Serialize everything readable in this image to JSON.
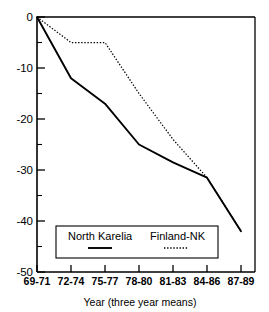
{
  "chart_data": {
    "type": "line",
    "title": "",
    "subtitle": "",
    "xlabel": "Year (three year means)",
    "ylabel": "",
    "categories": [
      "69-71",
      "72-74",
      "75-77",
      "78-80",
      "81-83",
      "84-86",
      "87-89"
    ],
    "series": [
      {
        "name": "North Karelia",
        "style": "solid",
        "color": "#000000",
        "values": [
          0,
          -12,
          -17,
          -25,
          -28.5,
          -31.5,
          -42
        ]
      },
      {
        "name": "Finland-NK",
        "style": "dotted",
        "color": "#000000",
        "values": [
          0,
          -5,
          -5,
          -15,
          -24,
          -31.5,
          -42
        ]
      }
    ],
    "ylim": [
      -50,
      0
    ],
    "yticks": [
      0,
      -10,
      -20,
      -30,
      -40,
      -50
    ],
    "ytick_labels": [
      "0",
      "-10",
      "-20",
      "-30",
      "-40",
      "-50"
    ],
    "xtick_labels": [
      "69-71",
      "72-74",
      "75-77",
      "78-80",
      "81-83",
      "84-86",
      "87-89"
    ],
    "grid": false,
    "legend_position": "lower-center",
    "legend_entries": [
      {
        "label": "North Karelia",
        "style": "solid"
      },
      {
        "label": "Finland-NK",
        "style": "dotted"
      }
    ]
  },
  "axes": {
    "x_title": "Year (three year means)",
    "y_ticks": [
      "0",
      "-10",
      "-20",
      "-30",
      "-40",
      "-50"
    ],
    "x_ticks": [
      "69-71",
      "72-74",
      "75-77",
      "78-80",
      "81-83",
      "84-86",
      "87-89"
    ]
  },
  "legend": {
    "series_1_label": "North Karelia",
    "series_2_label": "Finland-NK"
  }
}
